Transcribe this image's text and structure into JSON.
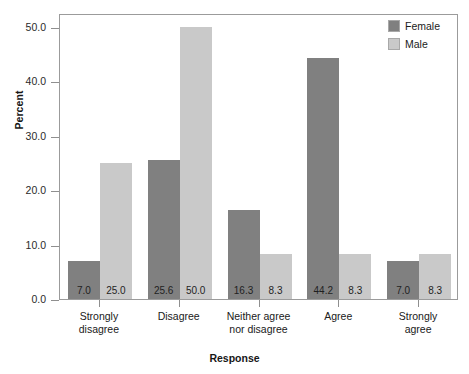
{
  "chart_data": {
    "type": "bar",
    "title": "",
    "subtitle": "",
    "xlabel": "Response",
    "ylabel": "Percent",
    "categories": [
      "Strongly\ndisagree",
      "Disagree",
      "Neither agree\nnor disagree",
      "Agree",
      "Strongly\nagree"
    ],
    "series": [
      {
        "name": "Female",
        "color": "#808080",
        "values": [
          7.0,
          25.6,
          16.3,
          44.2,
          7.0
        ]
      },
      {
        "name": "Male",
        "color": "#c9c9c9",
        "values": [
          25.0,
          50.0,
          8.3,
          8.3,
          8.3
        ]
      }
    ],
    "data_labels": [
      [
        "7.0",
        "25.0"
      ],
      [
        "25.6",
        "50.0"
      ],
      [
        "16.3",
        "8.3"
      ],
      [
        "44.2",
        "8.3"
      ],
      [
        "7.0",
        "8.3"
      ]
    ],
    "ylim": [
      0.0,
      52.5
    ],
    "yticks": [
      0.0,
      10.0,
      20.0,
      30.0,
      40.0,
      50.0
    ],
    "ytick_labels": [
      "0.0",
      "10.0",
      "20.0",
      "30.0",
      "40.0",
      "50.0"
    ],
    "grid": false,
    "legend_position": "top-right",
    "legend_entries": [
      "Female",
      "Male"
    ],
    "bars_grouped": true,
    "bar_gap_within_group": 0
  },
  "legend": {
    "items": [
      {
        "label": "Female",
        "color": "#808080"
      },
      {
        "label": "Male",
        "color": "#c9c9c9"
      }
    ]
  },
  "axes": {
    "y_title": "Percent",
    "x_title": "Response"
  },
  "colors": {
    "female": "#808080",
    "male": "#c9c9c9",
    "frame": "#9b9b9b",
    "text": "#1b1b1b",
    "background": "#ffffff"
  }
}
